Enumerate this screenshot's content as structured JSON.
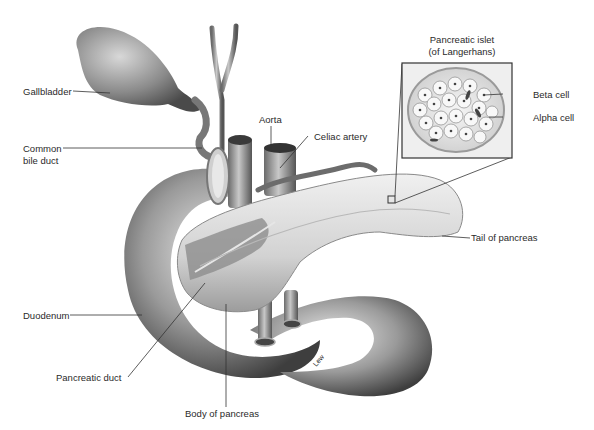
{
  "diagram": {
    "labels": {
      "gallbladder": "Gallbladder",
      "common_bile_duct_1": "Common",
      "common_bile_duct_2": "bile duct",
      "aorta": "Aorta",
      "celiac_artery": "Celiac artery",
      "islet_title_1": "Pancreatic islet",
      "islet_title_2": "(of Langerhans)",
      "beta_cell": "Beta cell",
      "alpha_cell": "Alpha cell",
      "tail_of_pancreas": "Tail of pancreas",
      "duodenum": "Duodenum",
      "pancreatic_duct": "Pancreatic duct",
      "body_of_pancreas": "Body of pancreas",
      "artist_signature": "Lew"
    },
    "colors": {
      "background": "#ffffff",
      "tissue_light": "#e4e4e4",
      "tissue_mid": "#a8a8a8",
      "tissue_dark": "#5a5a5a",
      "leader_line": "#333333",
      "label_text": "#2a2a2a"
    }
  }
}
